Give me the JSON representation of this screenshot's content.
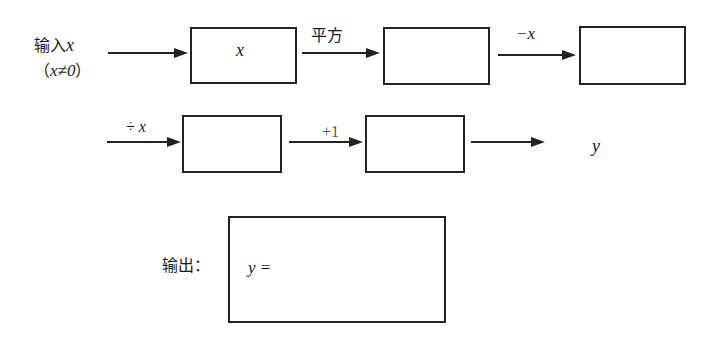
{
  "input": {
    "label": "输入",
    "var": "x",
    "condition_open": "（",
    "condition": "x≠0",
    "condition_close": "）"
  },
  "row1": {
    "box1_content": "x",
    "op1": "平方",
    "box2_content": "",
    "op2": "−x",
    "box3_content": ""
  },
  "row2": {
    "op3": "÷ x",
    "box4_content": "",
    "op4": "+1",
    "box5_content": "",
    "result_var": "y"
  },
  "output": {
    "label": "输出：",
    "expr": "y ="
  },
  "colors": {
    "stroke": "#222222",
    "text": "#1a1a1a",
    "background": "#ffffff"
  }
}
